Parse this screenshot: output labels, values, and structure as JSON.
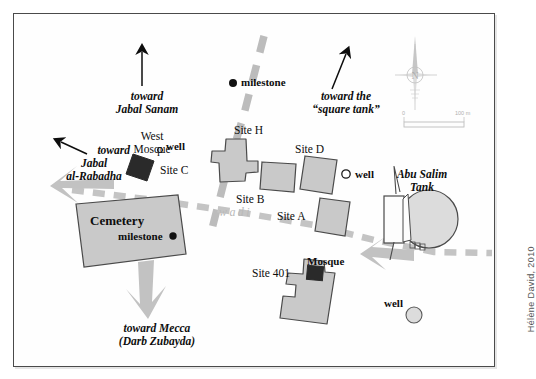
{
  "map": {
    "title": "Archaeological site plan of al-Rabadha area",
    "credit": "Hélène David, 2010",
    "background_color": "#fefefe",
    "frame_color": "#4a4a4a",
    "building_fill": "#c9c9c9",
    "building_stroke": "#4a4a4a",
    "dark_fill": "#2a2a2a",
    "road_color": "#bcbcbc",
    "wadi_color": "#c4c4c4",
    "arrow_gray": "#c2c2c2"
  },
  "direction_labels": [
    {
      "name": "toward-jabal-sanam",
      "line1": "toward",
      "line2": "Jabal Sanam"
    },
    {
      "name": "toward-square-tank",
      "line1": "toward the",
      "line2": "“square tank”"
    },
    {
      "name": "toward-jabal-al-rabadha",
      "line1": "toward",
      "line2": "Jabal",
      "line3": "al-Rabadha"
    },
    {
      "name": "toward-mecca",
      "line1": "toward Mecca",
      "line2": "(Darb Zubayda)"
    }
  ],
  "features": {
    "milestone_north": "milestone",
    "milestone_cemetery": "milestone",
    "west_mosque_line1": "West",
    "west_mosque_line2": "Mosque",
    "site_c": "Site C",
    "well_site_c": "well",
    "site_h": "Site H",
    "site_b": "Site B",
    "site_d": "Site D",
    "well_site_d": "well",
    "site_a": "Site A",
    "cemetery": "Cemetery",
    "site_401": "Site 401",
    "mosque": "Mosque",
    "well_south": "well",
    "abu_salim_line1": "Abu Salim",
    "abu_salim_line2": "Tank",
    "wadi": "wadi"
  },
  "compass": {
    "label": "N",
    "name": "compass-rose"
  },
  "scale_bar": {
    "start": "0",
    "end": "100 m"
  }
}
